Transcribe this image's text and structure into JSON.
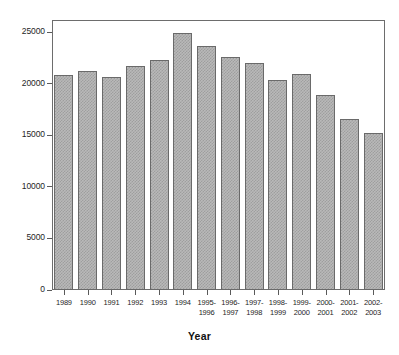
{
  "chart_data": {
    "type": "bar",
    "title": "",
    "xlabel": "Year",
    "ylabel": "",
    "categories": [
      "1989",
      "1990",
      "1991",
      "1992",
      "1993",
      "1994",
      "1995-\n1996",
      "1996-\n1997",
      "1997-\n1998",
      "1998-\n1999",
      "1999-\n2000",
      "2000-\n2001",
      "2001-\n2002",
      "2002-\n2003"
    ],
    "values": [
      20900,
      21250,
      20650,
      21750,
      22300,
      24950,
      23650,
      22600,
      22050,
      20350,
      21000,
      18950,
      16600,
      15250
    ],
    "ylim": [
      0,
      26200
    ],
    "yticks": [
      0,
      5000,
      10000,
      15000,
      20000,
      25000
    ],
    "ytick_labels": [
      "0",
      "5000",
      "10000",
      "15000",
      "20000",
      "25000"
    ],
    "grid": false,
    "legend": null,
    "bar_fill_color": "#b9b9b9",
    "bar_border_color": "#6a6a6a",
    "frame_color": "#6d6d6d",
    "axis_text_color": "#262626"
  }
}
